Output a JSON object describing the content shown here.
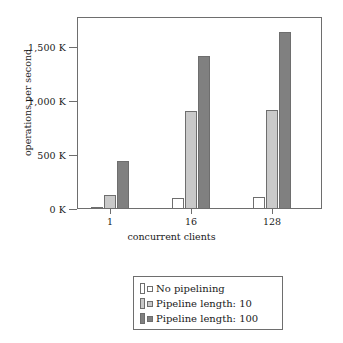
{
  "chart_data": {
    "type": "bar",
    "title": "",
    "xlabel": "concurrent clients",
    "ylabel": "operations per second",
    "categories": [
      "1",
      "16",
      "128"
    ],
    "ytick_labels": [
      "0 K",
      "500 K",
      "1,000 K",
      "1,500 K"
    ],
    "ytick_values": [
      0,
      500000,
      1000000,
      1500000
    ],
    "ylim": [
      0,
      1780000
    ],
    "grid": false,
    "legend_position": "below-plot",
    "series": [
      {
        "name": "No pipelining",
        "color": "#ffffff",
        "values": [
          20000,
          100000,
          110000
        ]
      },
      {
        "name": "Pipeline length: 10",
        "color": "#c9c9c9",
        "values": [
          130000,
          910000,
          925000
        ]
      },
      {
        "name": "Pipeline length: 100",
        "color": "#808080",
        "values": [
          450000,
          1430000,
          1650000
        ]
      }
    ]
  },
  "axes": {
    "y_title": "operations per second",
    "x_title": "concurrent clients"
  },
  "legend": {
    "entries": [
      {
        "label": "No pipelining"
      },
      {
        "label": "Pipeline length: 10"
      },
      {
        "label": "Pipeline length: 100"
      }
    ]
  },
  "colors": {
    "series_1": "#ffffff",
    "series_2": "#c9c9c9",
    "series_3": "#808080",
    "outline": "#6e6e6e",
    "text": "#1a1a1a"
  }
}
